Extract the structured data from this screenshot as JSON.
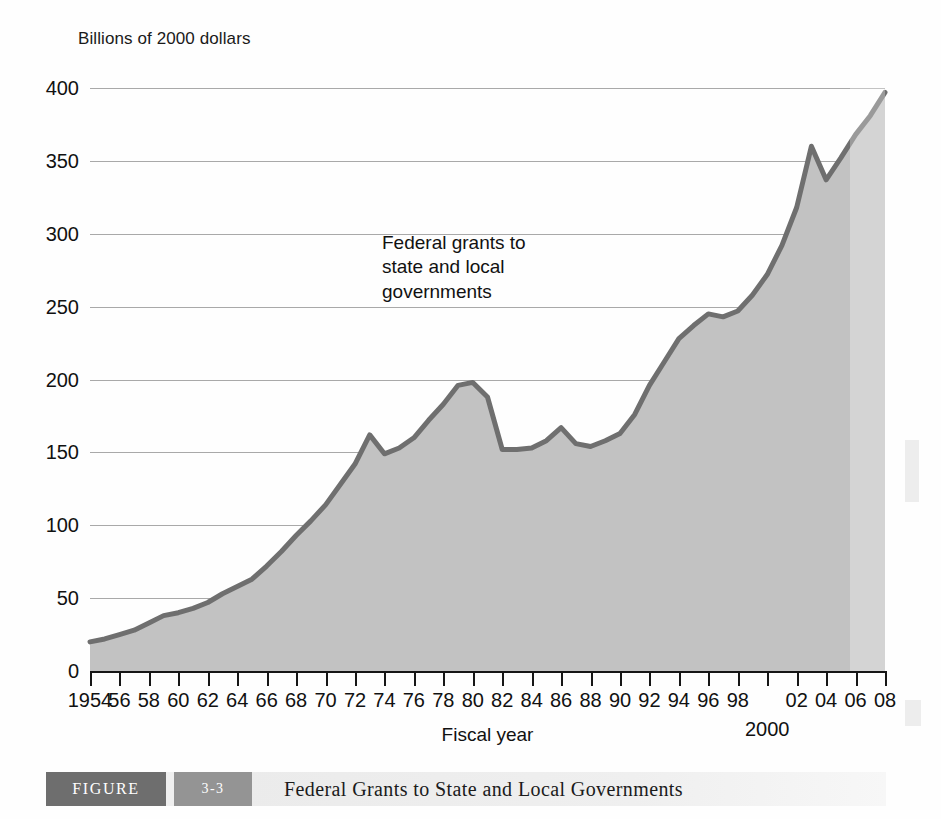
{
  "figure": {
    "caption_label": "FIGURE",
    "caption_number": "3-3",
    "caption_title": "Federal Grants to State and Local Governments"
  },
  "chart_data": {
    "type": "area",
    "title": "Federal Grants to State and Local Governments",
    "ylabel": "Billions of 2000 dollars",
    "xlabel": "Fiscal year",
    "annotation": "Federal grants to\nstate and local\ngovernments",
    "annotation_lines": [
      "Federal grants to",
      "state and local",
      "governments"
    ],
    "grid": true,
    "legend": "none",
    "xlim": [
      1954,
      2008
    ],
    "ylim": [
      0,
      400
    ],
    "yticks": [
      0,
      50,
      100,
      150,
      200,
      250,
      300,
      350,
      400
    ],
    "ytick_labels": [
      "0",
      "50",
      "100",
      "150",
      "200",
      "250",
      "300",
      "350",
      "400"
    ],
    "xticks": [
      1954,
      1956,
      1958,
      1960,
      1962,
      1964,
      1966,
      1968,
      1970,
      1972,
      1974,
      1976,
      1978,
      1980,
      1982,
      1984,
      1986,
      1988,
      1990,
      1992,
      1994,
      1996,
      1998,
      2000,
      2002,
      2004,
      2006,
      2008
    ],
    "xtick_labels": [
      "1954",
      "56",
      "58",
      "60",
      "62",
      "64",
      "66",
      "68",
      "70",
      "72",
      "74",
      "76",
      "78",
      "80",
      "82",
      "84",
      "86",
      "88",
      "90",
      "92",
      "94",
      "96",
      "98",
      "",
      "02",
      "04",
      "06",
      "08"
    ],
    "xtick_sublabel": {
      "year": 2000,
      "text": "2000"
    },
    "series": [
      {
        "name": "Federal grants to state and local governments",
        "line_color": "#6f6f6f",
        "fill_color": "#c2c2c2",
        "x": [
          1954,
          1955,
          1956,
          1957,
          1958,
          1959,
          1960,
          1961,
          1962,
          1963,
          1964,
          1965,
          1966,
          1967,
          1968,
          1969,
          1970,
          1971,
          1972,
          1973,
          1974,
          1975,
          1976,
          1977,
          1978,
          1979,
          1980,
          1981,
          1982,
          1983,
          1984,
          1985,
          1986,
          1987,
          1988,
          1989,
          1990,
          1991,
          1992,
          1993,
          1994,
          1995,
          1996,
          1997,
          1998,
          1999,
          2000,
          2001,
          2002,
          2003,
          2004,
          2005,
          2006,
          2007,
          2008
        ],
        "values": [
          20,
          22,
          25,
          28,
          33,
          38,
          40,
          43,
          47,
          53,
          58,
          63,
          72,
          82,
          93,
          103,
          114,
          128,
          142,
          162,
          149,
          153,
          160,
          172,
          183,
          196,
          198,
          188,
          152,
          152,
          153,
          158,
          167,
          156,
          154,
          158,
          163,
          176,
          196,
          212,
          228,
          237,
          245,
          243,
          247,
          258,
          272,
          292,
          318,
          360,
          337,
          352,
          368,
          381,
          397
        ]
      }
    ]
  }
}
